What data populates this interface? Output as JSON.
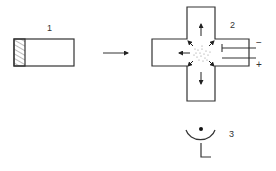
{
  "diagram": {
    "components": [
      {
        "id": "1",
        "label": "1",
        "description": "sample holder with hatched sample"
      },
      {
        "id": "2",
        "label": "2",
        "description": "ionization chamber (cross-shaped) with electrodes"
      },
      {
        "id": "3",
        "label": "3",
        "description": "detector"
      }
    ],
    "electrodes": {
      "negative": "−",
      "positive": "+"
    },
    "colors": {
      "line": "#333333",
      "background": "#ffffff"
    }
  }
}
